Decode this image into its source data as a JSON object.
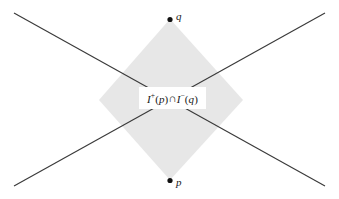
{
  "figure": {
    "kind": "spacetime-causal-diamond-diagram",
    "width": 339,
    "height": 199,
    "background_color": "#ffffff"
  },
  "region": {
    "name": "chronological-diamond",
    "fill_color": "#e7e7e7",
    "stroke_color": "#3a3a3a",
    "label_full": "I+(p) ∩ I-(q)",
    "label_parts": {
      "first_letter": "I",
      "first_sup": "+",
      "first_open": "(",
      "first_arg": "p",
      "first_close": ")",
      "operator": "∩",
      "second_letter": "I",
      "second_sup": "−",
      "second_open": "(",
      "second_arg": "q",
      "second_close": ")"
    }
  },
  "points": [
    {
      "id": "q",
      "label": "q",
      "role": "future-endpoint",
      "x": 170,
      "y": 19,
      "label_x": 176,
      "label_y": 11
    },
    {
      "id": "p",
      "label": "p",
      "role": "past-endpoint",
      "x": 170,
      "y": 180,
      "label_x": 176,
      "label_y": 177
    }
  ],
  "light_cone_lines": [
    {
      "name": "line-upper-left-to-lower-right",
      "x1": 14,
      "y1": 13,
      "x2": 325,
      "y2": 186,
      "stroke_color": "#3a3a3a"
    },
    {
      "name": "line-upper-right-to-lower-left",
      "x1": 325,
      "y1": 13,
      "x2": 14,
      "y2": 186,
      "stroke_color": "#3a3a3a"
    }
  ],
  "diamond_vertices": {
    "top": {
      "x": 170,
      "y": 19
    },
    "right": {
      "x": 243,
      "y": 100
    },
    "bottom": {
      "x": 170,
      "y": 180
    },
    "left": {
      "x": 99,
      "y": 100
    }
  },
  "colors": {
    "line": "#3a3a3a",
    "fill": "#e7e7e7",
    "text": "#171717",
    "dot": "#111111",
    "background": "#ffffff"
  }
}
